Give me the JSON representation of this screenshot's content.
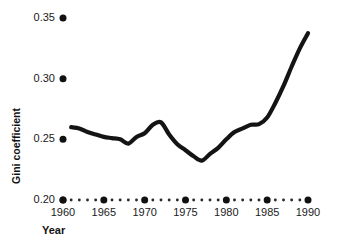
{
  "chart_data": {
    "type": "line",
    "title": "",
    "xlabel": "Year",
    "ylabel": "Gini coefficient",
    "xlim": [
      1959.5,
      1990.5
    ],
    "ylim": [
      0.2,
      0.355
    ],
    "grid": false,
    "legend": null,
    "x_major_ticks": [
      1960,
      1965,
      1970,
      1975,
      1980,
      1985,
      1990
    ],
    "x_tick_labels": [
      "1960",
      "1965",
      "1970",
      "1975",
      "1980",
      "1985",
      "1990"
    ],
    "x_minor_ticks": [
      1961,
      1962,
      1963,
      1964,
      1966,
      1967,
      1968,
      1969,
      1971,
      1972,
      1973,
      1974,
      1976,
      1977,
      1978,
      1979,
      1981,
      1982,
      1983,
      1984,
      1986,
      1987,
      1988,
      1989
    ],
    "y_ticks": [
      0.2,
      0.25,
      0.3,
      0.35
    ],
    "y_tick_labels": [
      "0.20",
      "0.25",
      "0.30",
      "0.35"
    ],
    "axis_style": "dotted-markers",
    "line_color": "#141414",
    "line_width": 4.2,
    "x": [
      1961,
      1962,
      1963,
      1964,
      1965,
      1966,
      1967,
      1968,
      1969,
      1970,
      1971,
      1972,
      1973,
      1974,
      1975,
      1976,
      1977,
      1978,
      1979,
      1980,
      1981,
      1982,
      1983,
      1984,
      1985,
      1986,
      1987,
      1988,
      1989,
      1990
    ],
    "values": [
      0.26,
      0.259,
      0.256,
      0.254,
      0.252,
      0.251,
      0.25,
      0.2465,
      0.252,
      0.255,
      0.262,
      0.264,
      0.254,
      0.246,
      0.241,
      0.236,
      0.2325,
      0.238,
      0.243,
      0.25,
      0.256,
      0.259,
      0.262,
      0.2625,
      0.268,
      0.28,
      0.294,
      0.31,
      0.325,
      0.3375
    ],
    "series": [
      {
        "name": "Gini coefficient",
        "values": [
          0.26,
          0.259,
          0.256,
          0.254,
          0.252,
          0.251,
          0.25,
          0.2465,
          0.252,
          0.255,
          0.262,
          0.264,
          0.254,
          0.246,
          0.241,
          0.236,
          0.2325,
          0.238,
          0.243,
          0.25,
          0.256,
          0.259,
          0.262,
          0.2625,
          0.268,
          0.28,
          0.294,
          0.31,
          0.325,
          0.3375
        ]
      }
    ],
    "annotations": []
  }
}
